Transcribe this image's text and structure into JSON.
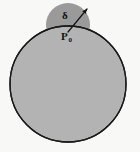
{
  "figure": {
    "background_color": "#f8f8f7",
    "labels": {
      "delta": "δ",
      "point": "P",
      "point_subscript": "0"
    },
    "shapes": {
      "large_disk": {
        "name": "large-disk",
        "cx": 68,
        "cy": 84,
        "r": 58,
        "fill": "#b3b3b3",
        "stroke": "#1a1a1a",
        "stroke_width": 1.3
      },
      "small_disk": {
        "name": "small-disk",
        "cx": 68,
        "cy": 25,
        "r": 22,
        "fill": "#9a9a9a",
        "stroke": "none",
        "stroke_width": 0
      },
      "radius_arrow": {
        "name": "radius-arrow",
        "x1": 68,
        "y1": 32,
        "x2": 87,
        "y2": 9,
        "stroke": "#141414",
        "stroke_width": 1.2
      }
    },
    "label_positions": {
      "delta": {
        "x": 62,
        "y": 19
      },
      "point": {
        "x": 61,
        "y": 40
      },
      "point_subscript": {
        "x": 68.5,
        "y": 42
      }
    }
  }
}
